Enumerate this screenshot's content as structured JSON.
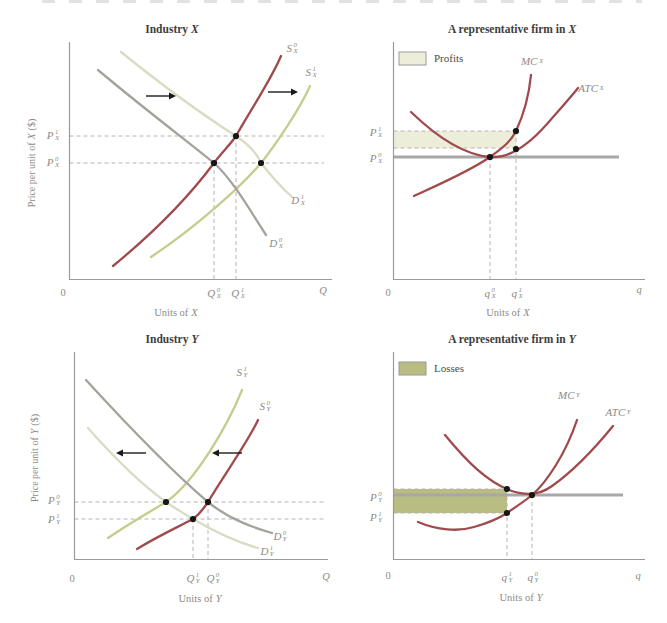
{
  "colors": {
    "supply_old": "#a04a4d",
    "supply_new": "#c6cb8e",
    "demand_old": "#a5a29c",
    "demand_new": "#d9dbc4",
    "cost_curve": "#a04a4d",
    "price_line": "#a8a8a8",
    "profit_fill": "#edeeda",
    "loss_fill": "#b9bd82",
    "dashed_line": "#b8b4ae",
    "axis": "#9a9a9a",
    "dot": "#161616",
    "label_gray": "#8d8a84",
    "title_text": "#3d3d3d"
  },
  "panels": {
    "industryX": {
      "title": {
        "prefix": "Industry",
        "var": "X"
      },
      "y_axis": {
        "prefix": "Price per unit of",
        "var": "X",
        "suffix": "($)"
      },
      "x_axis": {
        "prefix": "Units of",
        "var": "X"
      },
      "origin": "0",
      "axis_end": "Q",
      "labels": {
        "s0": {
          "base": "S",
          "sup": "0",
          "sub": "X"
        },
        "s1": {
          "base": "S",
          "sup": "1",
          "sub": "X"
        },
        "d0": {
          "base": "D",
          "sup": "0",
          "sub": "X"
        },
        "d1": {
          "base": "D",
          "sup": "1",
          "sub": "X"
        },
        "p1": {
          "base": "P",
          "sup": "1",
          "sub": "X"
        },
        "p0": {
          "base": "P",
          "sup": "0",
          "sub": "X"
        },
        "q0": {
          "base": "Q",
          "sup": "0",
          "sub": "X"
        },
        "q1": {
          "base": "Q",
          "sup": "1",
          "sub": "X"
        }
      }
    },
    "firmX": {
      "title": {
        "prefix": "A representative firm in",
        "var": "X"
      },
      "legend": {
        "label": "Profits"
      },
      "x_axis": {
        "prefix": "Units of",
        "var": "X"
      },
      "origin": "0",
      "axis_end": "q",
      "labels": {
        "mc": {
          "base": "MC",
          "sup": "",
          "sub": "X"
        },
        "atc": {
          "base": "ATC",
          "sup": "",
          "sub": "X"
        },
        "p1": {
          "base": "P",
          "sup": "1",
          "sub": "X"
        },
        "p0": {
          "base": "P",
          "sup": "0",
          "sub": "X"
        },
        "q0": {
          "base": "q",
          "sup": "0",
          "sub": "X"
        },
        "q1": {
          "base": "q",
          "sup": "1",
          "sub": "X"
        }
      }
    },
    "industryY": {
      "title": {
        "prefix": "Industry",
        "var": "Y"
      },
      "y_axis": {
        "prefix": "Price per unit of",
        "var": "Y",
        "suffix": "($)"
      },
      "x_axis": {
        "prefix": "Units of",
        "var": "Y"
      },
      "origin": "0",
      "axis_end": "Q",
      "labels": {
        "s1": {
          "base": "S",
          "sup": "1",
          "sub": "Y"
        },
        "s0": {
          "base": "S",
          "sup": "0",
          "sub": "Y"
        },
        "d0": {
          "base": "D",
          "sup": "0",
          "sub": "Y"
        },
        "d1": {
          "base": "D",
          "sup": "1",
          "sub": "Y"
        },
        "p0": {
          "base": "P",
          "sup": "0",
          "sub": "Y"
        },
        "p1": {
          "base": "P",
          "sup": "1",
          "sub": "Y"
        },
        "q1": {
          "base": "Q",
          "sup": "1",
          "sub": "Y"
        },
        "q0": {
          "base": "Q",
          "sup": "0",
          "sub": "Y"
        }
      }
    },
    "firmY": {
      "title": {
        "prefix": "A representative firm in",
        "var": "Y"
      },
      "legend": {
        "label": "Losses"
      },
      "x_axis": {
        "prefix": "Units of",
        "var": "Y"
      },
      "origin": "0",
      "axis_end": "q",
      "labels": {
        "mc": {
          "base": "MC",
          "sup": "",
          "sub": "Y"
        },
        "atc": {
          "base": "ATC",
          "sup": "",
          "sub": "Y"
        },
        "p0": {
          "base": "P",
          "sup": "0",
          "sub": "Y"
        },
        "p1": {
          "base": "P",
          "sup": "1",
          "sub": "Y"
        },
        "q1": {
          "base": "q",
          "sup": "1",
          "sub": "Y"
        },
        "q0": {
          "base": "q",
          "sup": "0",
          "sub": "Y"
        }
      }
    }
  }
}
